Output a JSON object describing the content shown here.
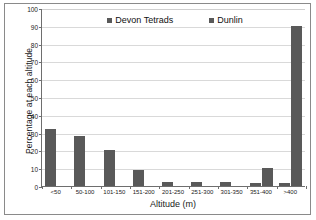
{
  "chart_data": {
    "type": "bar",
    "title": "",
    "xlabel": "Altitude (m)",
    "ylabel": "Percentage at each altitude",
    "categories": [
      "<50",
      "50-100",
      "101-150",
      "151-200",
      "201-250",
      "251-300",
      "301-350",
      "351-400",
      ">400"
    ],
    "series": [
      {
        "name": "Devon Tetrads",
        "color": "#595959",
        "values": [
          32,
          28,
          20,
          9,
          2.5,
          2.5,
          2,
          1.5,
          1.5
        ]
      },
      {
        "name": "Dunlin",
        "color": "#595959",
        "values": [
          0,
          0,
          0,
          0,
          0,
          0,
          0,
          10,
          90
        ]
      }
    ],
    "ylim": [
      0,
      100
    ],
    "ytick_step": 10,
    "yticks": [
      "0",
      "10",
      "20",
      "30",
      "40",
      "50",
      "60",
      "70",
      "80",
      "90",
      "100"
    ],
    "grid": true,
    "legend_position": "top-center"
  },
  "legend": {
    "entries": [
      {
        "label": "Devon Tetrads"
      },
      {
        "label": "Dunlin"
      }
    ]
  },
  "axes": {
    "x_title": "Altitude (m)",
    "y_title": "Percentage at each altitude"
  }
}
